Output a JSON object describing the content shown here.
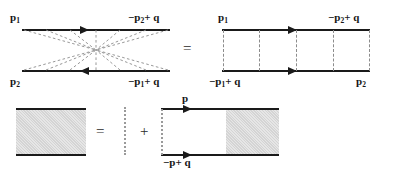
{
  "figure": {
    "colors": {
      "line": "#1a1a1a",
      "dashed": "#8c8c8c",
      "dotted": "#9a9a9a",
      "shade": "#dedede",
      "background": "#ffffff",
      "text": "#161616"
    }
  },
  "top_row": {
    "crossed_diagram": {
      "name": "crossed-ladder-diagram",
      "labels": {
        "top_left": "p",
        "top_left_sub": "1",
        "top_right_prefix": "−p",
        "top_right_sub": "2",
        "top_right_suffix": "+ q",
        "bottom_left": "p",
        "bottom_left_sub": "2",
        "bottom_right_prefix": "−p",
        "bottom_right_sub": "1",
        "bottom_right_suffix": "+ q"
      },
      "top_arrow_direction": "right",
      "bottom_arrow_direction": "left",
      "exchange_count": 10
    },
    "equals_sign": "=",
    "ladder_diagram": {
      "name": "ladder-diagram",
      "labels": {
        "top_left": "p",
        "top_left_sub": "1",
        "top_right_prefix": "−p",
        "top_right_sub": "2",
        "top_right_suffix": "+ q",
        "bottom_left_prefix": "−p",
        "bottom_left_sub": "1",
        "bottom_left_suffix": "+ q",
        "bottom_right": "p",
        "bottom_right_sub": "2"
      },
      "top_arrow_direction": "right",
      "bottom_arrow_direction": "right",
      "rung_count": 5
    }
  },
  "bottom_row": {
    "blob_left": {
      "name": "four-point-amplitude-blob"
    },
    "equals_sign": "=",
    "kernel": {
      "name": "interaction-kernel"
    },
    "plus_sign": "+",
    "iteration_diagram": {
      "name": "iterated-amplitude-diagram",
      "labels": {
        "top": "p",
        "bottom_prefix": "−p",
        "bottom_suffix": "+ q"
      },
      "top_arrow_direction": "right",
      "bottom_arrow_direction": "right"
    }
  }
}
